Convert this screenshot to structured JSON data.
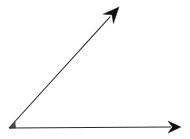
{
  "figure": {
    "title": "Acute angle formed by two rays",
    "type": "geometry-diagram",
    "canvas": {
      "width": 190,
      "height": 139,
      "background": "#ffffff"
    },
    "stroke_color": "#2b2b2b",
    "arrowhead_color": "#111111",
    "stroke_width": 1.1,
    "vertex": {
      "name": "angle-vertex",
      "x": 9,
      "y": 128
    },
    "rays": [
      {
        "name": "horizontal-ray",
        "label": "horizontal ray pointing right",
        "from": {
          "x": 9,
          "y": 128
        },
        "to": {
          "x": 181,
          "y": 127
        },
        "angle_degrees": 0,
        "arrowhead": "filled-triangle",
        "arrowhead_length": 13,
        "arrowhead_half_width": 6
      },
      {
        "name": "diagonal-ray",
        "label": "diagonal ray pointing up and to the right",
        "from": {
          "x": 9,
          "y": 128
        },
        "to": {
          "x": 119,
          "y": 7
        },
        "angle_degrees": 47.7,
        "arrowhead": "filled-triangle",
        "arrowhead_length": 16,
        "arrowhead_half_width": 7
      }
    ],
    "measured_angle_degrees": 47.7,
    "angle_classification": "acute",
    "labels": []
  }
}
